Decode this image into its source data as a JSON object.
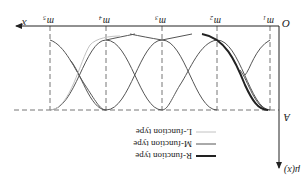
{
  "figure": {
    "orientation": "rotated-180",
    "axes": {
      "x_label": "x",
      "y_label": "μ(x)",
      "origin_label": "O",
      "level_label": "A"
    },
    "ticks": [
      {
        "label": "m",
        "sub": "1"
      },
      {
        "label": "m",
        "sub": "2"
      },
      {
        "label": "m",
        "sub": "3"
      },
      {
        "label": "m",
        "sub": "4"
      },
      {
        "label": "m",
        "sub": "5"
      }
    ],
    "legend": [
      {
        "label": "R-function type",
        "color": "#222222",
        "width": 2
      },
      {
        "label": "M-function type",
        "color": "#555555",
        "width": 1
      },
      {
        "label": "L-function type",
        "color": "#bbbbbb",
        "width": 1
      }
    ]
  }
}
